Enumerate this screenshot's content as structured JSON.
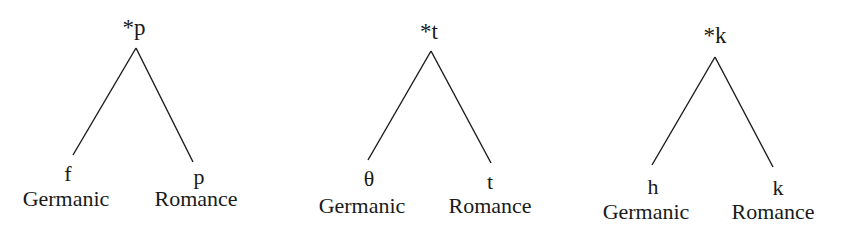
{
  "diagram": {
    "type": "sound-correspondence-trees",
    "trees": [
      {
        "root": "*p",
        "left": {
          "segment": "f",
          "language": "Germanic"
        },
        "right": {
          "segment": "p",
          "language": "Romance"
        }
      },
      {
        "root": "*t",
        "left": {
          "segment": "θ",
          "language": "Germanic"
        },
        "right": {
          "segment": "t",
          "language": "Romance"
        }
      },
      {
        "root": "*k",
        "left": {
          "segment": "h",
          "language": "Germanic"
        },
        "right": {
          "segment": "k",
          "language": "Romance"
        }
      }
    ],
    "colors": {
      "background": "#ffffff",
      "ink": "#1a1a1a"
    }
  }
}
